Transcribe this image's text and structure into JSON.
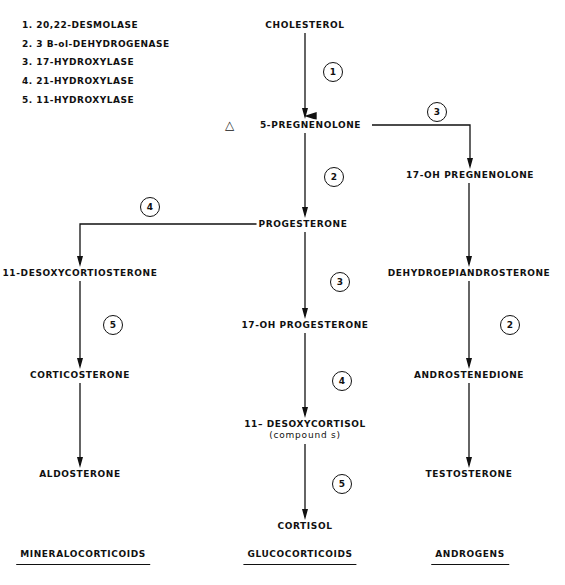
{
  "legend": {
    "items": [
      "1. 20,22-DESMOLASE",
      "2. 3  B-ol-DEHYDROGENASE",
      "3. 17-HYDROXYLASE",
      "4. 21-HYDROXYLASE",
      "5. 11-HYDROXYLASE"
    ]
  },
  "nodes": {
    "cholesterol": "CHOLESTEROL",
    "pregnenolone_symbol": "△",
    "pregnenolone": "5-PREGNENOLONE",
    "oh17_pregnenolone": "17-OH PREGNENOLONE",
    "progesterone": "PROGESTERONE",
    "desoxycorticosterone": "11-DESOXYCORTIOSTERONE",
    "dhea": "DEHYDROEPIANDROSTERONE",
    "oh17_progesterone": "17-OH PROGESTERONE",
    "corticosterone": "CORTICOSTERONE",
    "androstenedione": "ANDROSTENEDIONE",
    "desoxycortisol": "11– DESOXYCORTISOL",
    "desoxycortisol_sub": "(compound s)",
    "aldosterone": "ALDOSTERONE",
    "testosterone": "TESTOSTERONE",
    "cortisol": "CORTISOL"
  },
  "steps": {
    "chol_to_preg": "1",
    "preg_to_17ohpreg": "3",
    "preg_to_prog": "2",
    "prog_to_doc": "4",
    "prog_to_17ohprog": "3",
    "doc_to_cortico": "5",
    "dhea_to_andro": "2",
    "17ohprog_to_deoxycortisol": "4",
    "deoxycortisol_to_cortisol": "5"
  },
  "groups": {
    "mineralocorticoids": "MINERALOCORTICOIDS",
    "glucocorticoids": "GLUCOCORTICOIDS",
    "androgens": "ANDROGENS"
  },
  "colors": {
    "ink": "#111111",
    "background": "#ffffff"
  }
}
